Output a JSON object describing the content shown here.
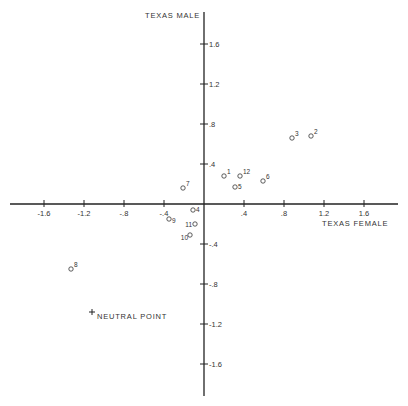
{
  "chart_data": {
    "type": "scatter",
    "title": "",
    "xlabel": "TEXAS FEMALE",
    "ylabel": "TEXAS MALE",
    "xlim": [
      -2.0,
      2.0
    ],
    "ylim": [
      -1.9,
      2.0
    ],
    "grid": false,
    "x_ticks": [
      -1.6,
      -1.2,
      -0.8,
      -0.4,
      0.4,
      0.8,
      1.2,
      1.6
    ],
    "x_tick_labels": [
      "-1.6",
      "-1.2",
      "-.8",
      "-.4",
      ".4",
      ".8",
      "1.2",
      "1.6"
    ],
    "y_ticks": [
      1.6,
      1.2,
      0.8,
      0.4,
      -0.4,
      -0.8,
      -1.2,
      -1.6
    ],
    "y_tick_labels": [
      "1.6",
      "1.2",
      ".8",
      ".4",
      "-.4",
      "-.8",
      "-1.2",
      "-1.6"
    ],
    "points": [
      {
        "label": "1",
        "x": 0.2,
        "y": 0.28
      },
      {
        "label": "2",
        "x": 1.07,
        "y": 0.68
      },
      {
        "label": "3",
        "x": 0.88,
        "y": 0.66
      },
      {
        "label": "4",
        "x": -0.11,
        "y": -0.06
      },
      {
        "label": "5",
        "x": 0.31,
        "y": 0.17
      },
      {
        "label": "6",
        "x": 0.59,
        "y": 0.23
      },
      {
        "label": "7",
        "x": -0.21,
        "y": 0.16
      },
      {
        "label": "8",
        "x": -1.33,
        "y": -0.65
      },
      {
        "label": "9",
        "x": -0.35,
        "y": -0.15
      },
      {
        "label": "10",
        "x": -0.14,
        "y": -0.31
      },
      {
        "label": "11",
        "x": -0.09,
        "y": -0.2
      },
      {
        "label": "12",
        "x": 0.36,
        "y": 0.28
      }
    ],
    "annotations": [
      {
        "text": "NEUTRAL POINT",
        "marker": "+",
        "x": -1.12,
        "y": -1.08
      }
    ]
  }
}
